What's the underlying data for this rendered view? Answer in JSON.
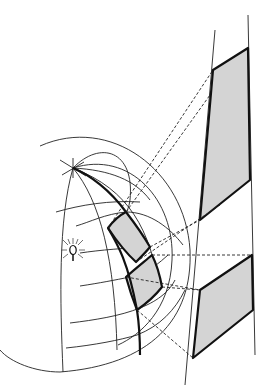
{
  "diagram": {
    "elements": {
      "globe": "hemisphere with meridians and parallels",
      "light_source": "light-bulb-icon at globe center",
      "shaded_regions_on_globe": 2,
      "shaded_regions_on_plane": 2,
      "projection_lines": "dashed"
    },
    "colors": {
      "line": "#222222",
      "fill": "#d4d4d4",
      "background": "#ffffff"
    }
  }
}
